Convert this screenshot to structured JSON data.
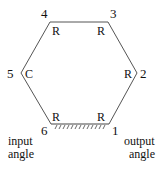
{
  "diagram": {
    "vertices": [
      {
        "id": "1",
        "label": "1",
        "joint": "R"
      },
      {
        "id": "2",
        "label": "2",
        "joint": "R"
      },
      {
        "id": "3",
        "label": "3",
        "joint": "R"
      },
      {
        "id": "4",
        "label": "4",
        "joint": "R"
      },
      {
        "id": "5",
        "label": "5",
        "joint": "C"
      },
      {
        "id": "6",
        "label": "6",
        "joint": "R"
      }
    ],
    "ground_link": {
      "from": "6",
      "to": "1"
    },
    "captions": {
      "input": [
        "input",
        "angle"
      ],
      "output": [
        "output",
        "angle"
      ]
    }
  }
}
